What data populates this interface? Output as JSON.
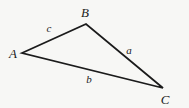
{
  "figure": {
    "type": "geometry-diagram",
    "shape": "triangle",
    "background_color": "#f7f7f5",
    "stroke_color": "#1b1b1b",
    "stroke_width": 1.8,
    "width": 189,
    "height": 108,
    "vertices": [
      {
        "id": "A",
        "label": "A",
        "x": 22,
        "y": 53,
        "label_x": 13,
        "label_y": 53
      },
      {
        "id": "B",
        "label": "B",
        "x": 86,
        "y": 24,
        "label_x": 85,
        "label_y": 12
      },
      {
        "id": "C",
        "label": "C",
        "x": 163,
        "y": 88,
        "label_x": 165,
        "label_y": 99
      }
    ],
    "sides": [
      {
        "id": "c",
        "label": "c",
        "from": "A",
        "to": "B",
        "label_x": 49,
        "label_y": 28
      },
      {
        "id": "a",
        "label": "a",
        "from": "B",
        "to": "C",
        "label_x": 129,
        "label_y": 50
      },
      {
        "id": "b",
        "label": "b",
        "from": "A",
        "to": "C",
        "label_x": 89,
        "label_y": 79
      }
    ],
    "polygon_points": "22,53 86,24 163,88"
  }
}
